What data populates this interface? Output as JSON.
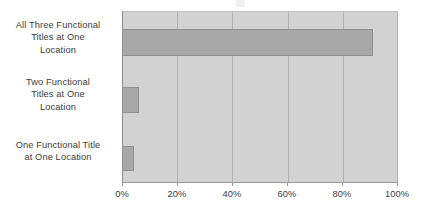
{
  "chart_data": {
    "type": "bar",
    "orientation": "horizontal",
    "title": "",
    "xlabel": "",
    "ylabel": "",
    "categories": [
      "All Three Functional Titles at One Location",
      "Two Functional Titles at One Location",
      "One Functional Title at One Location"
    ],
    "category_lines": [
      [
        "All Three Functional",
        "Titles at One",
        "Location"
      ],
      [
        "Two Functional",
        "Titles at One",
        "Location"
      ],
      [
        "One Functional Title",
        "at One Location"
      ]
    ],
    "values": [
      91,
      6,
      4.5
    ],
    "value_unit": "%",
    "xlim": [
      0,
      100
    ],
    "xticks": [
      0,
      20,
      40,
      60,
      80,
      100
    ],
    "xtick_labels": [
      "0%",
      "20%",
      "40%",
      "60%",
      "80%",
      "100%"
    ],
    "grid": true,
    "grid_axis": "x",
    "legend": false,
    "series": [
      {
        "name": "Percent of Respondents",
        "values": [
          91,
          6,
          4.5
        ]
      }
    ]
  },
  "style": {
    "plot_background": "#d2d2d2",
    "bar_fill": "#a8a8a8",
    "bar_border": "#909090",
    "gridline_color": "#b0b0b0",
    "axis_color": "#9a9a9a",
    "text_color": "#3b3b3b"
  }
}
